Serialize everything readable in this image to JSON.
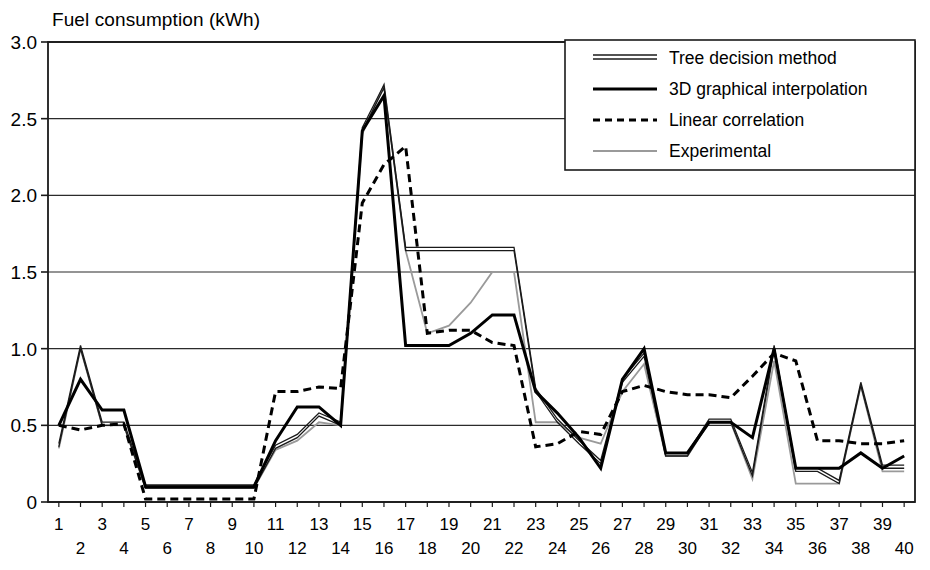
{
  "chart_data": {
    "type": "line",
    "title": "Fuel consumption (kWh)",
    "xlabel": "",
    "ylabel": "Fuel consumption (kWh)",
    "ylim": [
      0,
      3.0
    ],
    "xlim": [
      1,
      40
    ],
    "yticks": [
      "0",
      "0.5",
      "1.0",
      "1.5",
      "2.0",
      "2.5",
      "3.0"
    ],
    "ytick_values": [
      0,
      0.5,
      1.0,
      1.5,
      2.0,
      2.5,
      3.0
    ],
    "grid": "horizontal",
    "legend_position": "top-right",
    "x": [
      1,
      2,
      3,
      4,
      5,
      6,
      7,
      8,
      9,
      10,
      11,
      12,
      13,
      14,
      15,
      16,
      17,
      18,
      19,
      20,
      21,
      22,
      23,
      24,
      25,
      26,
      27,
      28,
      29,
      30,
      31,
      32,
      33,
      34,
      35,
      36,
      37,
      38,
      39,
      40
    ],
    "xtick_labels_top": [
      "1",
      "3",
      "5",
      "7",
      "9",
      "11",
      "13",
      "15",
      "17",
      "19",
      "21",
      "23",
      "25",
      "27",
      "29",
      "31",
      "33",
      "35",
      "37",
      "39"
    ],
    "xtick_labels_bottom": [
      "2",
      "4",
      "6",
      "8",
      "10",
      "12",
      "14",
      "16",
      "18",
      "20",
      "22",
      "24",
      "26",
      "28",
      "30",
      "32",
      "34",
      "36",
      "38",
      "40"
    ],
    "series": [
      {
        "name": "Tree decision method",
        "style": "double-line",
        "color": "#1a1a1a",
        "values": [
          0.36,
          1.0,
          0.5,
          0.5,
          0.09,
          0.09,
          0.09,
          0.09,
          0.09,
          0.09,
          0.35,
          0.42,
          0.56,
          0.5,
          2.42,
          2.7,
          1.64,
          1.64,
          1.64,
          1.64,
          1.64,
          1.64,
          0.72,
          0.52,
          0.38,
          0.25,
          0.78,
          0.95,
          0.3,
          0.3,
          0.52,
          0.52,
          0.17,
          1.0,
          0.2,
          0.2,
          0.12,
          0.76,
          0.22,
          0.22
        ]
      },
      {
        "name": "3D graphical interpolation",
        "style": "solid-thick",
        "color": "#000000",
        "values": [
          0.5,
          0.8,
          0.6,
          0.6,
          0.1,
          0.1,
          0.1,
          0.1,
          0.1,
          0.1,
          0.4,
          0.62,
          0.62,
          0.5,
          2.42,
          2.65,
          1.02,
          1.02,
          1.02,
          1.1,
          1.22,
          1.22,
          0.72,
          0.58,
          0.42,
          0.22,
          0.8,
          1.0,
          0.32,
          0.32,
          0.52,
          0.52,
          0.42,
          1.0,
          0.22,
          0.22,
          0.22,
          0.32,
          0.22,
          0.3
        ]
      },
      {
        "name": "Linear correlation",
        "style": "dashed",
        "color": "#000000",
        "values": [
          0.5,
          0.47,
          0.5,
          0.51,
          0.02,
          0.02,
          0.02,
          0.02,
          0.02,
          0.02,
          0.72,
          0.72,
          0.75,
          0.74,
          1.95,
          2.2,
          2.32,
          1.1,
          1.12,
          1.12,
          1.04,
          1.02,
          0.36,
          0.38,
          0.46,
          0.44,
          0.72,
          0.76,
          0.72,
          0.7,
          0.7,
          0.68,
          0.82,
          0.97,
          0.92,
          0.4,
          0.4,
          0.38,
          0.38,
          0.4
        ]
      },
      {
        "name": "Experimental",
        "style": "solid-thin",
        "color": "#9a9a9a",
        "values": [
          0.35,
          1.0,
          0.5,
          0.5,
          0.09,
          0.09,
          0.09,
          0.09,
          0.09,
          0.09,
          0.34,
          0.4,
          0.52,
          0.5,
          2.4,
          2.72,
          1.64,
          1.1,
          1.15,
          1.3,
          1.5,
          1.5,
          0.52,
          0.52,
          0.42,
          0.38,
          0.72,
          0.9,
          0.3,
          0.3,
          0.52,
          0.52,
          0.15,
          0.92,
          0.12,
          0.12,
          0.12,
          0.76,
          0.2,
          0.2
        ]
      }
    ]
  }
}
